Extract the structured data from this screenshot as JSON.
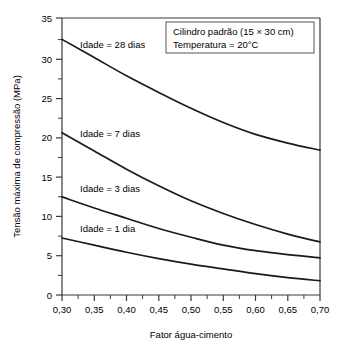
{
  "chart_data": {
    "type": "line",
    "title": "",
    "xlabel": "Fator água-cimento",
    "ylabel": "Tensão máxima de compressão (MPa)",
    "xlim": [
      0.3,
      0.7
    ],
    "ylim": [
      0,
      35
    ],
    "grid": false,
    "legend_position": "inline-labels",
    "xticks": [
      "0,30",
      "0,35",
      "0,40",
      "0,45",
      "0,50",
      "0,55",
      "0,60",
      "0,65",
      "0,70"
    ],
    "xtick_values": [
      0.3,
      0.35,
      0.4,
      0.45,
      0.5,
      0.55,
      0.6,
      0.65,
      0.7
    ],
    "yticks": [
      "0",
      "5",
      "10",
      "15",
      "20",
      "25",
      "30",
      "35"
    ],
    "ytick_values": [
      0,
      5,
      10,
      15,
      20,
      25,
      30,
      35
    ],
    "x": [
      0.3,
      0.35,
      0.4,
      0.45,
      0.5,
      0.55,
      0.6,
      0.65,
      0.7
    ],
    "series": [
      {
        "name": "Idade = 28 dias",
        "label": "Idade = 28 dias",
        "values": [
          32.3,
          30.0,
          27.7,
          25.6,
          23.6,
          21.8,
          20.3,
          19.2,
          18.3
        ]
      },
      {
        "name": "Idade = 7 dias",
        "label": "Idade = 7 dias",
        "values": [
          20.5,
          18.2,
          15.9,
          13.8,
          11.9,
          10.3,
          8.9,
          7.7,
          6.7
        ]
      },
      {
        "name": "Idade = 3 dias",
        "label": "Idade = 3 dias",
        "values": [
          12.4,
          11.0,
          9.7,
          8.4,
          7.3,
          6.3,
          5.6,
          5.1,
          4.7
        ]
      },
      {
        "name": "Idade = 1 dia",
        "label": "Idade = 1 dia",
        "values": [
          7.2,
          6.3,
          5.4,
          4.6,
          3.9,
          3.3,
          2.7,
          2.2,
          1.8
        ]
      }
    ],
    "annotations": [
      "Cilindro padrão (15 × 30 cm)",
      "Temperatura = 20°C"
    ]
  },
  "colors": {
    "curve": "#1a1a1a",
    "axis": "#3a3a3a",
    "background": "#ffffff",
    "annotation_border": "#555555"
  }
}
